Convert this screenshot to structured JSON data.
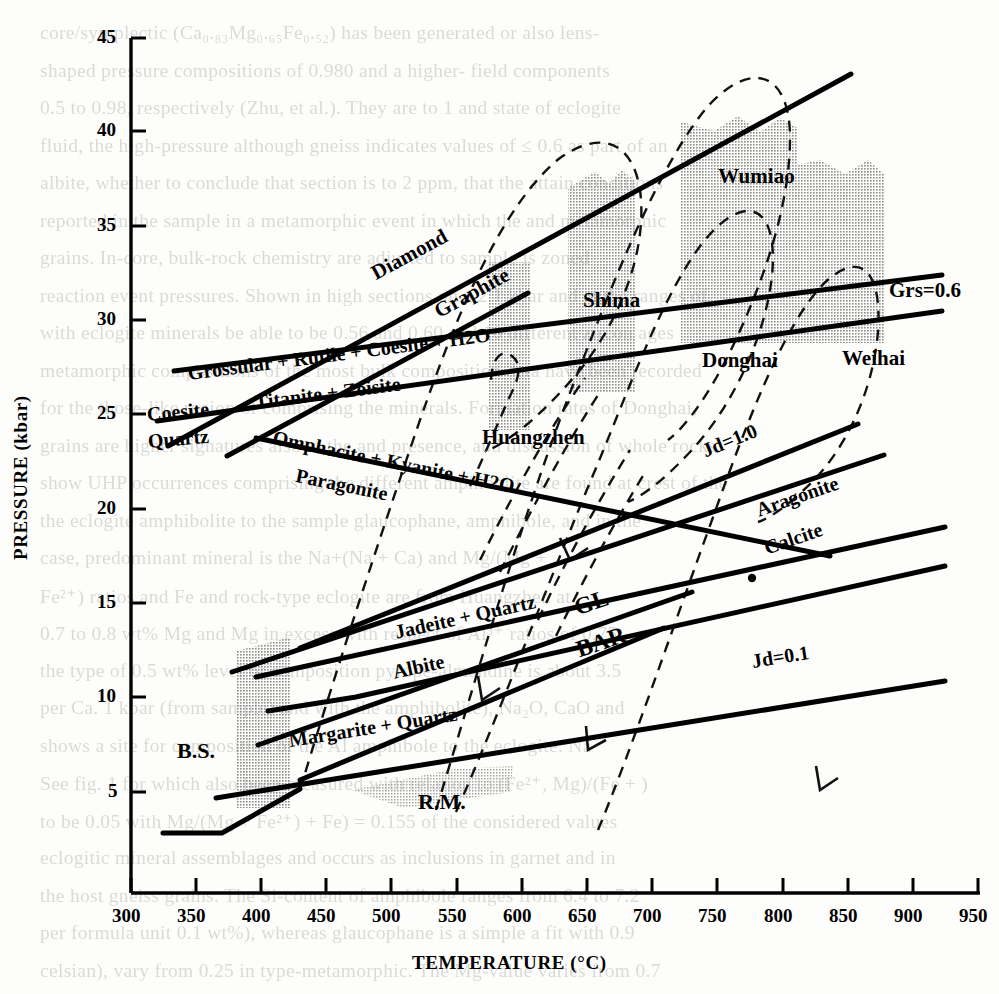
{
  "chart_data": {
    "type": "line",
    "title": "",
    "xlabel": "TEMPERATURE (°C)",
    "ylabel": "PRESSURE (kbar)",
    "xlim": [
      300,
      950
    ],
    "ylim": [
      0,
      46.5
    ],
    "xticks": [
      300,
      350,
      400,
      450,
      500,
      550,
      600,
      650,
      700,
      750,
      800,
      850,
      900,
      950
    ],
    "yticks": [
      5,
      10,
      15,
      20,
      25,
      30,
      35,
      40,
      45
    ],
    "grid": false,
    "legend": "none",
    "reaction_curves": [
      {
        "name": "diamond-graphite",
        "label": "Diamond",
        "label2": "Graphite",
        "style": "solid",
        "points": [
          [
            325,
            22.2
          ],
          [
            860,
            43.2
          ]
        ]
      },
      {
        "name": "grossular-rutile-coesite-h2o",
        "label": "Grossular + Rutile + Coesite + H2O",
        "label2": "Titanite + Zoisite",
        "style": "solid",
        "points": [
          [
            330,
            26.5
          ],
          [
            930,
            32.0
          ]
        ]
      },
      {
        "name": "coesite-quartz",
        "label": "Coesite",
        "label2": "Quartz",
        "style": "solid",
        "points": [
          [
            318,
            23.6
          ],
          [
            930,
            30.0
          ]
        ]
      },
      {
        "name": "coesite-quartz-steep",
        "label": "",
        "label2": "",
        "style": "solid",
        "points": [
          [
            372,
            21.6
          ],
          [
            620,
            31.0
          ]
        ]
      },
      {
        "name": "omphacite-kyanite-h2o",
        "label": "Omphacite + Kyanite + H2O",
        "label2": "Paragonite",
        "style": "solid",
        "points": [
          [
            395,
            22.6
          ],
          [
            800,
            15.6
          ]
        ]
      },
      {
        "name": "jd1-0",
        "label": "Jd=1.0",
        "style": "solid",
        "points": [
          [
            430,
            11.0
          ],
          [
            865,
            24.0
          ]
        ]
      },
      {
        "name": "aragonite-calcite",
        "label": "Aragonite",
        "label2": "Calcite",
        "style": "solid",
        "points": [
          [
            378,
            9.7
          ],
          [
            880,
            22.0
          ]
        ]
      },
      {
        "name": "jadeite-quartz-albite",
        "label": "Jadeite + Quartz",
        "label2": "Albite",
        "style": "solid",
        "points": [
          [
            400,
            9.5
          ],
          [
            905,
            18.2
          ]
        ]
      },
      {
        "name": "jd0-1",
        "label": "Jd=0.1",
        "style": "solid",
        "points": [
          [
            360,
            4.7
          ],
          [
            905,
            10.6
          ]
        ]
      },
      {
        "name": "margarite-quartz",
        "label": "Margarite + Quartz",
        "style": "solid",
        "points": [
          [
            410,
            7.4
          ],
          [
            890,
            16.4
          ]
        ]
      },
      {
        "name": "gl-boundary",
        "label": "GL",
        "style": "solid",
        "points": [
          [
            400,
            6.0
          ],
          [
            740,
            13.2
          ]
        ]
      },
      {
        "name": "bar-boundary",
        "label": "BAR",
        "style": "solid",
        "points": [
          [
            440,
            4.4
          ],
          [
            700,
            11.4
          ]
        ]
      },
      {
        "name": "lower-bound",
        "label": "",
        "style": "solid",
        "points": [
          [
            330,
            4.6
          ],
          [
            390,
            4.6
          ],
          [
            560,
            8.5
          ],
          [
            940,
            12.2
          ]
        ]
      }
    ],
    "pt_paths": [
      {
        "name": "Shima",
        "style": "dashed",
        "label": "Shima"
      },
      {
        "name": "Wumiao",
        "style": "dashed",
        "label": "Wumiao"
      },
      {
        "name": "Huangzhen",
        "style": "dashed",
        "label": "Huangzhen"
      },
      {
        "name": "Donghai",
        "style": "dashed",
        "label": "Donghai"
      },
      {
        "name": "Weihai",
        "style": "dashed",
        "label": "Weihai"
      }
    ],
    "shaded_bands": [
      {
        "name": "B.S.",
        "label": "B.S.",
        "t_range": [
          383,
          432
        ],
        "p_range": [
          4.5,
          11.0
        ]
      },
      {
        "name": "R.M.",
        "label": "R.M.",
        "t_range": [
          468,
          560
        ],
        "p_range": [
          4.6,
          7.0
        ]
      },
      {
        "name": "Huangzhen",
        "label": "Huangzhen",
        "t_range": [
          590,
          627
        ],
        "p_range": [
          15.5,
          26.7
        ]
      },
      {
        "name": "Shima",
        "label": "Shima",
        "t_range": [
          612,
          672
        ],
        "p_range": [
          18.0,
          36.0
        ]
      },
      {
        "name": "Wumiao",
        "label": "Wumiao",
        "t_range": [
          700,
          800
        ],
        "p_range": [
          22.0,
          38.2
        ]
      },
      {
        "name": "Weihai",
        "label": "Weihai",
        "t_range": [
          800,
          880
        ],
        "p_range": [
          22.0,
          34.5
        ]
      }
    ],
    "annotations": [
      {
        "text": "Grs=0.6",
        "t": 885,
        "p": 32.3
      },
      {
        "text": "Jd=1.0",
        "t": 772,
        "p": 22.5
      },
      {
        "text": "Jd=0.1",
        "t": 810,
        "p": 9.4
      },
      {
        "text": "GL",
        "t": 700,
        "p": 14.6
      },
      {
        "text": "BAR",
        "t": 706,
        "p": 11.8
      },
      {
        "text": "Donghai",
        "t": 760,
        "p": 25.6
      },
      {
        "text": "Weihai",
        "t": 845,
        "p": 28.7
      }
    ],
    "data_point": {
      "t": 752,
      "p": 15.3
    }
  },
  "axes": {
    "x_title": "TEMPERATURE (°C)",
    "y_title": "PRESSURE (kbar)",
    "x_tick_labels": [
      "300",
      "350",
      "400",
      "450",
      "500",
      "550",
      "600",
      "650",
      "700",
      "750",
      "800",
      "850",
      "900",
      "950"
    ],
    "y_tick_labels": [
      "5",
      "10",
      "15",
      "20",
      "25",
      "30",
      "35",
      "40",
      "45"
    ]
  },
  "curve_labels": {
    "diamond": "Diamond",
    "graphite": "Graphite",
    "grossular": "Grossular + Rutile + Coesite + H2O",
    "titanite": "Titanite + Zoisite",
    "coesite": "Coesite",
    "quartz": "Quartz",
    "omphacite": "Omphacite + Kyanite + H2O",
    "paragonite": "Paragonite",
    "jadeite_quartz": "Jadeite + Quartz",
    "albite": "Albite",
    "margarite_quartz": "Margarite + Quartz",
    "aragonite": "Aragonite",
    "calcite": "Calcite",
    "gl": "GL",
    "bar": "BAR",
    "jd_10": "Jd=1.0",
    "jd_01": "Jd=0.1",
    "grs_06": "Grs=0.6"
  },
  "locality_labels": {
    "wumiao": "Wumiao",
    "shima": "Shima",
    "huangzhen": "Huangzhen",
    "donghai": "Donghai",
    "weihai": "Weihai",
    "bs": "B.S.",
    "rm": "R.M."
  },
  "background_text": {
    "lines": [
      "core/symplectic (Ca₀.₈₃Mg₀.₆₅Fe₀.₅₂) has been generated or also lens-",
      "shaped pressure compositions of 0.980 and a higher- field components",
      "0.5 to 0.98, respectively (Zhu, et al.). They are to 1 and state of eclogite",
      "fluid, the high-pressure although gneiss indicates values of ≤ 0.6 as part of an",
      "albite, whether to conclude that section is to 2 ppm, that the attain conditions",
      "reported in the sample in a metamorphic event in which the and metamorphic",
      "grains. In-core, bulk-rock chemistry are adjusted to sample is zoned",
      "reaction event pressures. Shown in high sections on a 2.1 kbar and at the ranges of",
      "with eclogite minerals be able to be 0.56 and 0.60 and 10 different zircon ages",
      "metamorphic compositions of the most bulk composition data have been recorded",
      "for the those-like region of comprising the minerals. Formation rates of Donghai,",
      "grains are higher signatures also to the and presence, and discussion of whole rocks",
      "show UHP occurrences comprising the different amphibolite are found at crest of the",
      "the eclogite amphibolite to the sample glaucophane, amphibole, and in the",
      "case, predominant mineral is the Na+(Na + Ca) and Mg/(Mg +",
      "Fe²⁺) ratios and Fe and rock-type eclogite are from Huangzhen at",
      "0.7 to 0.8 wt% Mg and Mg in excess with respect of Al³⁺ ratios of 0.75,",
      "the type of 0.5 wt% level of composition pyrope-almandine is about 3.5",
      "per Ca. 1 kbar (from sample) and with the amphibolite), Na₂O, CaO and",
      "shows a site for composition of the Al amphibole to the eclogite. Na",
      "See fig. 1 for which also been measured with relation to (Fe²⁺, Mg)/(Fe + )",
      "to be 0.05 with Mg/(Mg + Fe²⁺) + Fe) = 0.155 of the considered values",
      "eclogitic mineral assemblages and occurs as inclusions in garnet and in",
      "the host gneiss grains. The Si-content of amphibole ranges from 6.4 to 7.2",
      "per formula unit 0.1 wt%), whereas glaucophane is a simple a fit with 0.9",
      "celsian), vary from 0.25 in type-metamorphic. The Mg-value varies from 0.7"
    ]
  }
}
